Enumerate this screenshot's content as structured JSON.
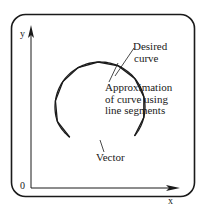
{
  "diagram": {
    "axes": {
      "y_label": "y",
      "x_label": "x",
      "origin_label": "0"
    },
    "labels": {
      "desired_curve": [
        "Desired",
        "curve"
      ],
      "approximation": [
        "Approximation",
        "of curve using",
        "line segments"
      ],
      "vector": "Vector"
    },
    "colors": {
      "ink": "#1a1a1a",
      "background": "#ffffff"
    },
    "curve": {
      "type": "open-circle-arc",
      "center": [
        100,
        107
      ],
      "radius": 45,
      "start_angle_deg": -40,
      "end_angle_deg": 225,
      "segments": 10
    }
  }
}
